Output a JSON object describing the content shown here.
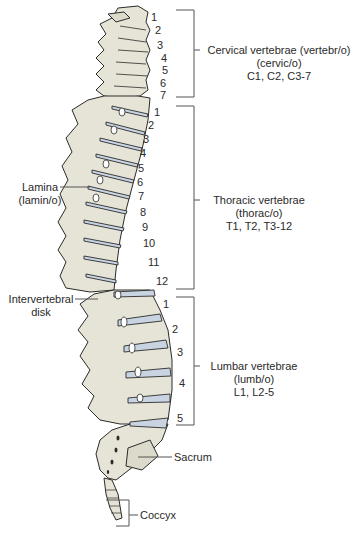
{
  "colors": {
    "bone": "#e6e4d6",
    "bone_outline": "#2b2b2b",
    "disk": "#c9d4e3",
    "bracket": "#555555",
    "text": "#2a2a2a",
    "background": "#ffffff"
  },
  "regions": {
    "cervical": {
      "title": "Cervical vertebrae (vertebr/o)",
      "combining_form": "(cervic/o)",
      "abbrev": "C1, C2, C3-7",
      "numbers": [
        "1",
        "2",
        "3",
        "4",
        "5",
        "6",
        "7"
      ]
    },
    "thoracic": {
      "title": "Thoracic vertebrae",
      "combining_form": "(thorac/o)",
      "abbrev": "T1, T2, T3-12",
      "numbers": [
        "1",
        "2",
        "3",
        "4",
        "5",
        "6",
        "7",
        "8",
        "9",
        "10",
        "11",
        "12"
      ]
    },
    "lumbar": {
      "title": "Lumbar vertebrae",
      "combining_form": "(lumb/o)",
      "abbrev": "L1, L2-5",
      "numbers": [
        "1",
        "2",
        "3",
        "4",
        "5"
      ]
    }
  },
  "side_labels": {
    "lamina": {
      "title": "Lamina",
      "combining_form": "(lamin/o)"
    },
    "intervertebral_disk": {
      "line1": "Intervertebral",
      "line2": "disk"
    },
    "sacrum": "Sacrum",
    "coccyx": "Coccyx"
  }
}
